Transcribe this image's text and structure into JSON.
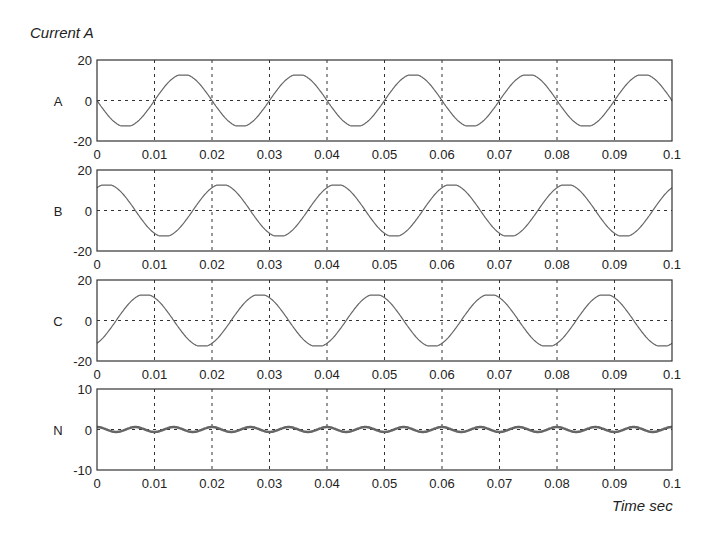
{
  "figure": {
    "ylabel": "Current A",
    "xlabel": "Time sec"
  },
  "chart_data": [
    {
      "type": "line",
      "title": "A",
      "xlabel": "",
      "ylabel": "A",
      "xlim": [
        0,
        0.1
      ],
      "ylim": [
        -20,
        20
      ],
      "xticks": [
        "0",
        "0.01",
        "0.02",
        "0.03",
        "0.04",
        "0.05",
        "0.06",
        "0.07",
        "0.08",
        "0.09",
        "0.1"
      ],
      "yticks": [
        "20",
        "0",
        "-20"
      ],
      "grid": true,
      "series": [
        {
          "name": "A",
          "amplitude": 12.5,
          "frequency_hz": 50,
          "phase_deg": 180,
          "description": "sinusoid starting at 0, min -12.5 at t=0.005, max +12.5 at t=0.015"
        }
      ]
    },
    {
      "type": "line",
      "title": "B",
      "xlabel": "",
      "ylabel": "B",
      "xlim": [
        0,
        0.1
      ],
      "ylim": [
        -20,
        20
      ],
      "xticks": [
        "0",
        "0.01",
        "0.02",
        "0.03",
        "0.04",
        "0.05",
        "0.06",
        "0.07",
        "0.08",
        "0.09",
        "0.1"
      ],
      "yticks": [
        "20",
        "0",
        "-20"
      ],
      "grid": true,
      "series": [
        {
          "name": "B",
          "amplitude": 12.5,
          "frequency_hz": 50,
          "phase_deg": 60,
          "description": "starts near +11, max at t≈0.0017, min at t≈0.0117"
        }
      ]
    },
    {
      "type": "line",
      "title": "C",
      "xlabel": "",
      "ylabel": "C",
      "xlim": [
        0,
        0.1
      ],
      "ylim": [
        -20,
        20
      ],
      "xticks": [
        "0",
        "0.01",
        "0.02",
        "0.03",
        "0.04",
        "0.05",
        "0.06",
        "0.07",
        "0.08",
        "0.09",
        "0.1"
      ],
      "yticks": [
        "20",
        "0",
        "-20"
      ],
      "grid": true,
      "series": [
        {
          "name": "C",
          "amplitude": 12.5,
          "frequency_hz": 50,
          "phase_deg": 300,
          "description": "starts near -11, max at t≈0.0083, min at t≈0.0183"
        }
      ]
    },
    {
      "type": "line",
      "title": "N",
      "xlabel": "Time sec",
      "ylabel": "N",
      "xlim": [
        0,
        0.1
      ],
      "ylim": [
        -10,
        10
      ],
      "xticks": [
        "0",
        "0.01",
        "0.02",
        "0.03",
        "0.04",
        "0.05",
        "0.06",
        "0.07",
        "0.08",
        "0.09",
        "0.1"
      ],
      "yticks": [
        "10",
        "0",
        "-10"
      ],
      "grid": true,
      "series": [
        {
          "name": "N",
          "amplitude": 0.6,
          "frequency_hz": 150,
          "phase_deg": 90,
          "description": "small neutral ripple around 0, ~±0.6, third-harmonic"
        }
      ]
    }
  ],
  "style": {
    "line_color": "#666666",
    "axis_color": "#333333",
    "grid_color": "#333333"
  }
}
